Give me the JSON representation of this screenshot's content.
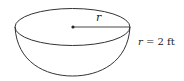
{
  "figure": {
    "shape": "hemisphere",
    "radius_label": "r",
    "given": {
      "variable": "r",
      "equals": "=",
      "value": "2 ft",
      "text": "r = 2 ft"
    }
  },
  "colors": {
    "stroke": "#333333",
    "background": "#ffffff"
  }
}
